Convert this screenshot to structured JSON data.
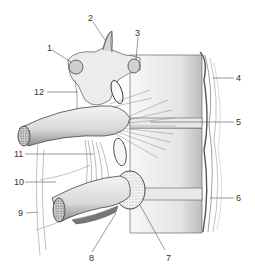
{
  "figure": {
    "labels": [
      {
        "id": "1",
        "text": "1",
        "x": 47,
        "y": 44
      },
      {
        "id": "2",
        "text": "2",
        "x": 88,
        "y": 14
      },
      {
        "id": "3",
        "text": "3",
        "x": 135,
        "y": 29
      },
      {
        "id": "4",
        "text": "4",
        "x": 236,
        "y": 74
      },
      {
        "id": "5",
        "text": "5",
        "x": 236,
        "y": 118
      },
      {
        "id": "6",
        "text": "6",
        "x": 236,
        "y": 194
      },
      {
        "id": "7",
        "text": "7",
        "x": 166,
        "y": 254
      },
      {
        "id": "8",
        "text": "8",
        "x": 89,
        "y": 254
      },
      {
        "id": "9",
        "text": "9",
        "x": 18,
        "y": 209
      },
      {
        "id": "10",
        "text": "10",
        "x": 14,
        "y": 178
      },
      {
        "id": "11",
        "text": "11",
        "x": 14,
        "y": 150
      },
      {
        "id": "12",
        "text": "12",
        "x": 36,
        "y": 88
      }
    ]
  }
}
